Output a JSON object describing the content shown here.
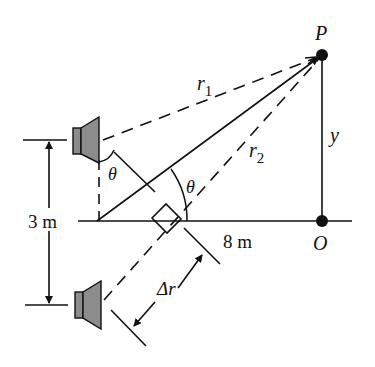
{
  "figure": {
    "type": "physics-diagram",
    "labels": {
      "point_P": "P",
      "point_O": "O",
      "r1": "r",
      "r1_sub": "1",
      "r2": "r",
      "r2_sub": "2",
      "y": "y",
      "theta_top": "θ",
      "theta_center": "θ",
      "separation": "3 m",
      "distance": "8 m",
      "delta_r": "Δr"
    },
    "colors": {
      "line": "#111111",
      "speaker_fill": "#8c8c8c",
      "background": "#ffffff"
    }
  }
}
